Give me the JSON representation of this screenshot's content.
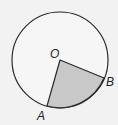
{
  "diagram": {
    "type": "circle-sector",
    "circle": {
      "cx": 60,
      "cy": 60,
      "r": 48,
      "stroke": "#2a2a2a",
      "fill": "#f6f6f6"
    },
    "center": {
      "label": "O",
      "x": 60,
      "y": 60
    },
    "points": [
      {
        "label": "A",
        "x": 47,
        "y": 106
      },
      {
        "label": "B",
        "x": 104,
        "y": 78
      }
    ],
    "sector": {
      "from": "A",
      "to": "B",
      "fill": "#c8c8c8"
    },
    "labels": {
      "O": {
        "text": "O",
        "x": 50,
        "y": 58
      },
      "A": {
        "text": "A",
        "x": 37,
        "y": 120
      },
      "B": {
        "text": "B",
        "x": 106,
        "y": 86
      }
    }
  }
}
